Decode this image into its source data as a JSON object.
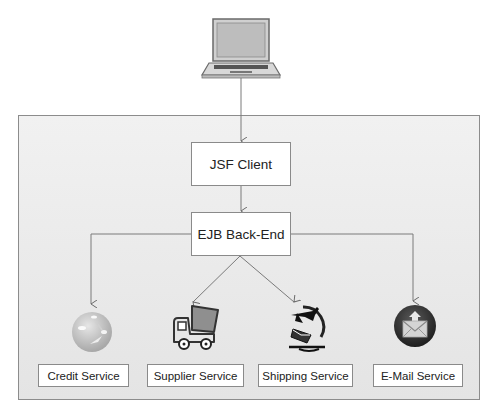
{
  "diagram": {
    "client_device": {
      "icon": "laptop-icon"
    },
    "nodes": {
      "jsf_client": "JSF Client",
      "ejb_backend": "EJB Back-End"
    },
    "services": [
      {
        "label": "Credit Service",
        "icon": "globe-icon"
      },
      {
        "label": "Supplier Service",
        "icon": "dump-truck-icon"
      },
      {
        "label": "Shipping Service",
        "icon": "airplane-globe-mail-icon"
      },
      {
        "label": "E-Mail Service",
        "icon": "envelope-circle-icon"
      }
    ],
    "colors": {
      "container_fill": "#e8e8e8",
      "line": "#7a7a7a",
      "box_border": "#8a8a8a",
      "email_circle": "#3a3a3a"
    }
  }
}
